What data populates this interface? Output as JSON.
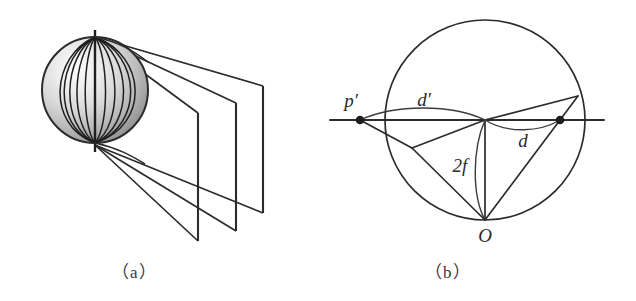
{
  "figure": {
    "panels": [
      {
        "id": "a",
        "caption": "（a）",
        "description": "sphere-with-meridians-projecting-onto-vertical-planes",
        "elements": {
          "sphere_name": "shaded-sphere",
          "axis_name": "polar-axis",
          "meridian_count": 11,
          "projection_line_count": 6,
          "plane_count": 3
        }
      },
      {
        "id": "b",
        "caption": "（b）",
        "description": "circle-tangent-line-projection-geometry",
        "labels": {
          "p_prime": "p′",
          "d_prime": "d′",
          "d": "d",
          "two_f": "2f",
          "origin": "O"
        }
      }
    ]
  },
  "colors": {
    "stroke": "#2b2b2b",
    "thin_stroke": "#3c3c3c",
    "text": "#3a3a3a",
    "sphere_light": "#f2f2f2",
    "sphere_mid": "#c8c8c8",
    "sphere_dark": "#7d7d7d"
  }
}
